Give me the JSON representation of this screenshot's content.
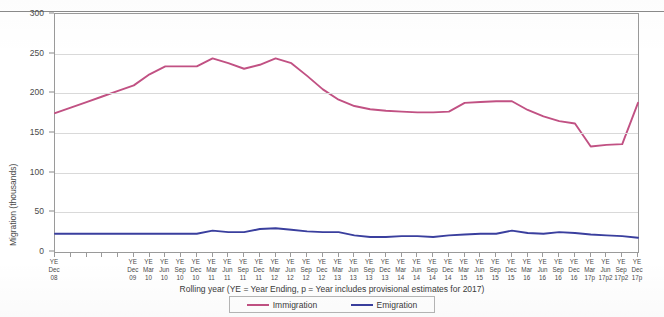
{
  "chart_data": {
    "type": "line",
    "title": "",
    "xlabel": "Rolling year (YE = Year Ending, p = Year includes provisional  estimates for  2017)",
    "ylabel": "Migration (thousands)",
    "ylim": [
      0,
      300
    ],
    "yticks": [
      0,
      50,
      100,
      150,
      200,
      250,
      300
    ],
    "grid": true,
    "legend_position": "bottom",
    "categories": [
      "YE Dec 08",
      "",
      "",
      "",
      "",
      "YE Dec 09",
      "YE Mar 10",
      "YE Jun 10",
      "YE Sep 10",
      "YE Dec 10",
      "YE Mar 11",
      "YE Jun 11",
      "YE Sep 11",
      "YE Dec 11",
      "YE Mar 12",
      "YE Jun 12",
      "YE Sep 12",
      "YE Dec 12",
      "YE Mar 13",
      "YE Jun 13",
      "YE Sep 13",
      "YE Dec 13",
      "YE Mar 14",
      "YE Jun 14",
      "YE Sep 14",
      "YE Dec 14",
      "YE Mar 15",
      "YE Jun 15",
      "YE Sep 15",
      "YE Dec 15",
      "YE Mar 16",
      "YE Jun 16",
      "YE Sep 16",
      "YE Dec 16",
      "YE Mar 17p",
      "YE Jun 17p2",
      "YE Sep 17p2",
      "YE Dec 17p"
    ],
    "tick_labels": [
      {
        "line1": "YE",
        "line2": "Dec",
        "line3": "08"
      },
      {
        "line1": "YE",
        "line2": "Dec",
        "line3": "09"
      },
      {
        "line1": "YE",
        "line2": "Mar",
        "line3": "10"
      },
      {
        "line1": "YE",
        "line2": "Jun",
        "line3": "10"
      },
      {
        "line1": "YE",
        "line2": "Sep",
        "line3": "10"
      },
      {
        "line1": "YE",
        "line2": "Dec",
        "line3": "10"
      },
      {
        "line1": "YE",
        "line2": "Mar",
        "line3": "11"
      },
      {
        "line1": "YE",
        "line2": "Jun",
        "line3": "11"
      },
      {
        "line1": "YE",
        "line2": "Sep",
        "line3": "11"
      },
      {
        "line1": "YE",
        "line2": "Dec",
        "line3": "11"
      },
      {
        "line1": "YE",
        "line2": "Mar",
        "line3": "12"
      },
      {
        "line1": "YE",
        "line2": "Jun",
        "line3": "12"
      },
      {
        "line1": "YE",
        "line2": "Sep",
        "line3": "12"
      },
      {
        "line1": "YE",
        "line2": "Dec",
        "line3": "12"
      },
      {
        "line1": "YE",
        "line2": "Mar",
        "line3": "13"
      },
      {
        "line1": "YE",
        "line2": "Jun",
        "line3": "13"
      },
      {
        "line1": "YE",
        "line2": "Sep",
        "line3": "13"
      },
      {
        "line1": "YE",
        "line2": "Dec",
        "line3": "13"
      },
      {
        "line1": "YE",
        "line2": "Mar",
        "line3": "14"
      },
      {
        "line1": "YE",
        "line2": "Jun",
        "line3": "14"
      },
      {
        "line1": "YE",
        "line2": "Sep",
        "line3": "14"
      },
      {
        "line1": "YE",
        "line2": "Dec",
        "line3": "14"
      },
      {
        "line1": "YE",
        "line2": "Mar",
        "line3": "15"
      },
      {
        "line1": "YE",
        "line2": "Jun",
        "line3": "15"
      },
      {
        "line1": "YE",
        "line2": "Sep",
        "line3": "15"
      },
      {
        "line1": "YE",
        "line2": "Dec",
        "line3": "15"
      },
      {
        "line1": "YE",
        "line2": "Mar",
        "line3": "16"
      },
      {
        "line1": "YE",
        "line2": "Jun",
        "line3": "16"
      },
      {
        "line1": "YE",
        "line2": "Sep",
        "line3": "16"
      },
      {
        "line1": "YE",
        "line2": "Dec",
        "line3": "16"
      },
      {
        "line1": "YE",
        "line2": "Mar",
        "line3": "17p"
      },
      {
        "line1": "YE",
        "line2": "Jun",
        "line3": "17p2"
      },
      {
        "line1": "YE",
        "line2": "Sep",
        "line3": "17p2"
      },
      {
        "line1": "YE",
        "line2": "Dec",
        "line3": "17p"
      }
    ],
    "tick_label_index": [
      0,
      5,
      6,
      7,
      8,
      9,
      10,
      11,
      12,
      13,
      14,
      15,
      16,
      17,
      18,
      19,
      20,
      21,
      22,
      23,
      24,
      25,
      26,
      27,
      28,
      29,
      30,
      31,
      32,
      33,
      34,
      35,
      36,
      37
    ],
    "series": [
      {
        "name": "Immigration",
        "color": "#c15183",
        "values": [
          175,
          182,
          189,
          196,
          203,
          210,
          224,
          234,
          234,
          234,
          244,
          238,
          231,
          236,
          244,
          238,
          222,
          205,
          192,
          184,
          180,
          178,
          177,
          176,
          176,
          177,
          188,
          189,
          190,
          190,
          179,
          171,
          165,
          162,
          133,
          135,
          136,
          188
        ]
      },
      {
        "name": "Emigration",
        "color": "#3a3f9e",
        "values": [
          23,
          23,
          23,
          23,
          23,
          23,
          23,
          23,
          23,
          23,
          27,
          25,
          25,
          29,
          30,
          28,
          26,
          25,
          25,
          21,
          19,
          19,
          20,
          20,
          19,
          21,
          22,
          23,
          23,
          27,
          24,
          23,
          25,
          24,
          22,
          21,
          20,
          18
        ]
      }
    ],
    "legend": [
      {
        "label": "Immigration",
        "color": "#c15183"
      },
      {
        "label": "Emigration",
        "color": "#3a3f9e"
      }
    ]
  }
}
